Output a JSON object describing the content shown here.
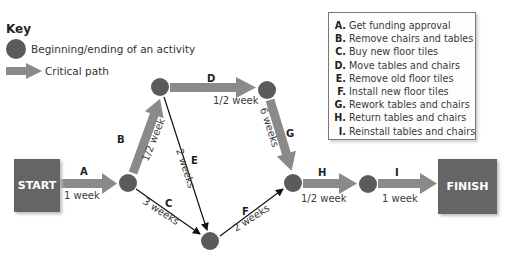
{
  "key": {
    "title": "Key",
    "node_label": "Beginning/ending of an activity",
    "critical_label": "Critical path"
  },
  "legend": {
    "items": [
      {
        "letter": "A.",
        "text": "Get funding approval"
      },
      {
        "letter": "B.",
        "text": "Remove chairs and tables"
      },
      {
        "letter": "C.",
        "text": "Buy new floor tiles"
      },
      {
        "letter": "D.",
        "text": "Move tables and chairs"
      },
      {
        "letter": "E.",
        "text": "Remove old floor tiles"
      },
      {
        "letter": "F.",
        "text": "Install new floor tiles"
      },
      {
        "letter": "G.",
        "text": "Rework tables and chairs"
      },
      {
        "letter": "H.",
        "text": "Return tables and chairs"
      },
      {
        "letter": "I.",
        "text": "Reinstall tables and chairs"
      }
    ]
  },
  "start_label": "START",
  "finish_label": "FINISH",
  "activities": {
    "A": {
      "letter": "A",
      "duration": "1 week",
      "critical": true
    },
    "B": {
      "letter": "B",
      "duration": "1/2 week",
      "critical": true
    },
    "C": {
      "letter": "C",
      "duration": "3 weeks",
      "critical": false
    },
    "D": {
      "letter": "D",
      "duration": "1/2 week",
      "critical": true
    },
    "E": {
      "letter": "E",
      "duration": "2 weeks",
      "critical": false
    },
    "F": {
      "letter": "F",
      "duration": "2 weeks",
      "critical": false
    },
    "G": {
      "letter": "G",
      "duration": "6 weeks",
      "critical": true
    },
    "H": {
      "letter": "H",
      "duration": "1/2 week",
      "critical": true
    },
    "I": {
      "letter": "I",
      "duration": "1 week",
      "critical": true
    }
  },
  "colors": {
    "node": "#5b5b5b",
    "critical_arrow": "#8a8a8a",
    "terminal": "#656565",
    "normal_arrow": "#111111"
  }
}
